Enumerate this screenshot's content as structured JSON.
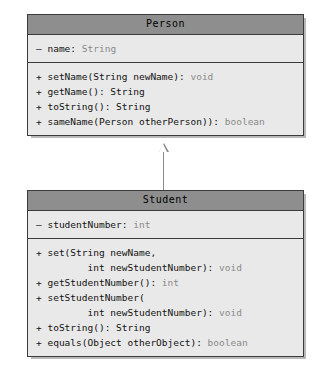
{
  "diagram": {
    "type": "uml-class-diagram",
    "classes": [
      {
        "name": "Person",
        "attributes": [
          {
            "visibility": "–",
            "text": " name: ",
            "type": "String"
          }
        ],
        "methods": [
          {
            "visibility": "+",
            "text": " setName(String newName): ",
            "type": "void"
          },
          {
            "visibility": "+",
            "text": " getName(): String",
            "type": ""
          },
          {
            "visibility": "+",
            "text": " toString(): String",
            "type": ""
          },
          {
            "visibility": "+",
            "text": " sameName(Person otherPerson)): ",
            "type": "boolean"
          }
        ]
      },
      {
        "name": "Student",
        "attributes": [
          {
            "visibility": "–",
            "text": " studentNumber: ",
            "type": "int"
          }
        ],
        "methods": [
          {
            "visibility": "+",
            "text": " set(String newName,",
            "type": ""
          },
          {
            "visibility": " ",
            "text": "        int newStudentNumber): ",
            "type": "void"
          },
          {
            "visibility": "+",
            "text": " getStudentNumber(): ",
            "type": "int"
          },
          {
            "visibility": "+",
            "text": " setStudentNumber(",
            "type": ""
          },
          {
            "visibility": " ",
            "text": "        int newStudentNumber): ",
            "type": "void"
          },
          {
            "visibility": "+",
            "text": " toString(): String",
            "type": ""
          },
          {
            "visibility": "+",
            "text": " equals(Object otherObject): ",
            "type": "boolean"
          }
        ]
      }
    ],
    "relationship": {
      "kind": "generalization",
      "from": "Student",
      "to": "Person",
      "arrow": "hollow-triangle"
    },
    "colors": {
      "title_bar": "#8e8e8e",
      "body": "#e9e9e9",
      "border": "#3b3b3b",
      "type_text": "#8a8a8a",
      "connector": "#8a8a8a",
      "background": "#ffffff"
    }
  }
}
